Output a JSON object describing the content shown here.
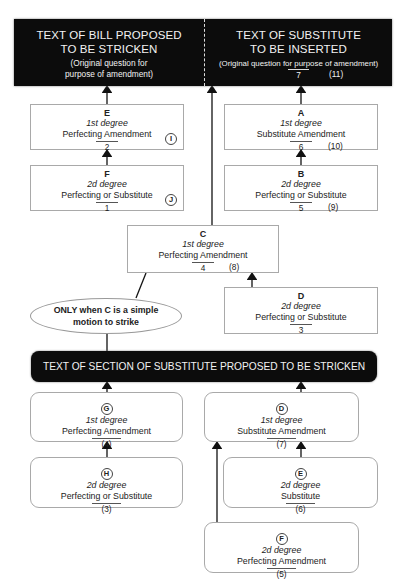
{
  "diagram": {
    "top_box": {
      "left": {
        "title_line1": "TEXT OF BILL PROPOSED",
        "title_line2": "TO BE STRICKEN",
        "note_line1": "(Original question for",
        "note_line2": "purpose of amendment)"
      },
      "right": {
        "title_line1": "TEXT OF SUBSTITUTE",
        "title_line2": "TO BE INSERTED",
        "note": "(Original question for purpose of amendment)",
        "number": "7",
        "paren_number": "(11)"
      }
    },
    "upper_boxes": {
      "E": {
        "letter": "E",
        "degree": "1st degree",
        "kind": "Perfecting Amendment",
        "number": "2",
        "circle": "I"
      },
      "F": {
        "letter": "F",
        "degree": "2d degree",
        "kind": "Perfecting or Substitute",
        "number": "1",
        "circle": "J"
      },
      "A": {
        "letter": "A",
        "degree": "1st degree",
        "kind": "Substitute Amendment",
        "number": "6",
        "paren_number": "(10)"
      },
      "B": {
        "letter": "B",
        "degree": "2d degree",
        "kind": "Perfecting or Substitute",
        "number": "5",
        "paren_number": "(9)"
      },
      "C": {
        "letter": "C",
        "degree": "1st degree",
        "kind": "Perfecting Amendment",
        "number": "4",
        "paren_number": "(8)"
      },
      "D": {
        "letter": "D",
        "degree": "2d degree",
        "kind": "Perfecting or Substitute",
        "number": "3"
      }
    },
    "ellipse": {
      "line1_bold_prefix": "ONLY",
      "line1_rest": " when ",
      "line1_bold_c": "C",
      "line1_end": " is a simple",
      "line2": "motion to strike"
    },
    "section_bar": {
      "label": "TEXT OF SECTION OF SUBSTITUTE PROPOSED TO BE STRICKEN"
    },
    "lower_boxes": {
      "G": {
        "circle": "G",
        "degree": "1st degree",
        "kind": "Perfecting Amendment",
        "number": "(4)"
      },
      "H": {
        "circle": "H",
        "degree": "2d degree",
        "kind": "Perfecting or Substitute",
        "number": "(3)"
      },
      "D": {
        "circle": "D",
        "degree": "1st degree",
        "kind": "Substitute Amendment",
        "number": "(7)"
      },
      "E": {
        "circle": "E",
        "degree": "2d degree",
        "kind": "Substitute",
        "number": "(6)"
      },
      "F": {
        "circle": "F",
        "degree": "2d degree",
        "kind": "Perfecting Amendment",
        "number": "(5)"
      }
    },
    "colors": {
      "dark_fill": "#0c0c0c",
      "box_border": "#a9a9a9",
      "arrow": "#111111"
    }
  }
}
